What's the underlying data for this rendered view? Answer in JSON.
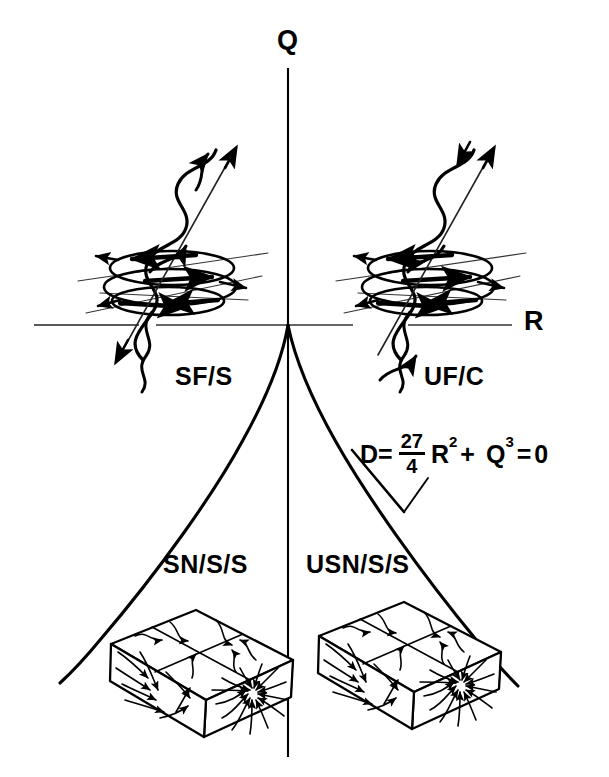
{
  "diagram": {
    "background_color": "#ffffff",
    "line_color": "#000000"
  },
  "axes": {
    "vertical": {
      "name": "Q-axis",
      "label": "Q",
      "label_x": 277,
      "label_y": 27,
      "x": 288,
      "y_top": 68,
      "y_bottom": 757
    },
    "horizontal": {
      "name": "R-axis",
      "label": "R",
      "label_x": 524,
      "label_y": 308,
      "y": 325,
      "x_left": 34,
      "x_right": 512
    },
    "origin": {
      "x": 288,
      "y": 325
    }
  },
  "region_labels": [
    {
      "id": "sf-s",
      "text": "SF/S",
      "x": 175,
      "y": 364,
      "quadrant": "upper-left",
      "meaning": "stable focus / stretching"
    },
    {
      "id": "uf-c",
      "text": "UF/C",
      "x": 424,
      "y": 364,
      "quadrant": "upper-right",
      "meaning": "unstable focus / compressing"
    },
    {
      "id": "sn-s-s",
      "text": "SN/S/S",
      "x": 163,
      "y": 552,
      "quadrant": "lower-left",
      "meaning": "stable node / saddle / saddle"
    },
    {
      "id": "usn-s-s",
      "text": "USN/S/S",
      "x": 306,
      "y": 552,
      "quadrant": "lower-right",
      "meaning": "unstable node / saddle / saddle"
    }
  ],
  "formula": {
    "name": "discriminant-equation",
    "x": 360,
    "y": 432,
    "lhs": "D=",
    "fraction_numerator": "27",
    "fraction_denominator": "4",
    "term1_base": "R",
    "term1_exponent": "2",
    "operator": "+",
    "term2_base": "Q",
    "term2_exponent": "3",
    "equals": "=",
    "rhs": "0",
    "plain_text": "D = 27/4 R^2 + Q^3 = 0"
  },
  "leader_line": {
    "name": "formula-leader-line",
    "from_x": 428,
    "from_y": 478,
    "mid_x": 404,
    "mid_y": 512,
    "to_x": 352,
    "to_y": 450
  },
  "discriminant_curve": {
    "name": "discriminant-cusp-curve",
    "description": "Cusp curve D = 27/4 R^2 + Q^3 = 0 emanating from the origin into the lower half plane",
    "left_branch": "M288,325 C283,355 268,395 243,440 C215,492 160,570 100,640 C86,657 72,672 60,683",
    "right_branch": "M288,325 C294,355 310,396 336,442 C366,495 420,572 478,642 C492,659 506,674 518,686"
  },
  "sketches": [
    {
      "id": "stable-focus-stretching",
      "name": "spiral-sketch-left",
      "caption_ref": "SF/S",
      "cx": 172,
      "cy": 248,
      "description": "Helical trajectory spiralling up through an elliptical orbit plane with outward arrows (stable focus / stretching)"
    },
    {
      "id": "unstable-focus-compressing",
      "name": "spiral-sketch-right",
      "caption_ref": "UF/C",
      "cx": 430,
      "cy": 248,
      "description": "Helical trajectory spiralling down through an elliptical orbit plane with inward arrows (unstable focus / compressing)"
    },
    {
      "id": "stable-node-saddle-saddle",
      "name": "box-sketch-left",
      "caption_ref": "SN/S/S",
      "cx": 205,
      "cy": 675,
      "description": "3D box with streamline pattern converging to a node on the top face and saddles on the side faces"
    },
    {
      "id": "unstable-node-saddle-saddle",
      "name": "box-sketch-right",
      "caption_ref": "USN/S/S",
      "cx": 385,
      "cy": 675,
      "description": "3D box with streamline pattern diverging from a node on the top face and saddles on the side faces"
    }
  ]
}
